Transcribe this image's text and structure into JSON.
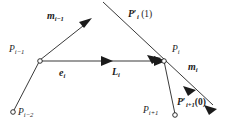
{
  "figure": {
    "type": "geometry-diagram",
    "background_color": "#ffffff",
    "stroke_color": "#3a3a3a",
    "text_color": "#1b1b1b"
  },
  "labels": {
    "m_prev": {
      "base": "m",
      "sub": "i−1"
    },
    "p_tangent_end": {
      "base": "P",
      "prime": "′",
      "sub": "i",
      "arg": "(1)"
    },
    "point_prev": {
      "base": "P",
      "sub": "i−1"
    },
    "point_current": {
      "base": "P",
      "sub": "i"
    },
    "point_prev2": {
      "base": "P",
      "sub": "i−2"
    },
    "point_next": {
      "base": "P",
      "sub": "i+1"
    },
    "edge_e": {
      "base": "e",
      "sub": "i"
    },
    "edge_L": {
      "base": "L",
      "sub": "i"
    },
    "m_current": {
      "base": "m",
      "sub": "i"
    },
    "p_tangent_start": {
      "base": "P",
      "prime": "′",
      "sub": "i+1",
      "arg": "(0)"
    }
  },
  "nodes": [
    {
      "name": "P_i-2",
      "x": 13,
      "y": 112
    },
    {
      "name": "P_i-1",
      "x": 40,
      "y": 60
    },
    {
      "name": "P_i",
      "x": 164,
      "y": 61
    },
    {
      "name": "P_i+1",
      "x": 175,
      "y": 115
    }
  ],
  "segments": [
    {
      "name": "edge-prev2-to-prev",
      "x1": 13,
      "y1": 112,
      "x2": 40,
      "y2": 60
    },
    {
      "name": "edge-prev-to-current",
      "x1": 40,
      "y1": 61,
      "x2": 164,
      "y2": 61
    },
    {
      "name": "edge-current-to-next",
      "x1": 164,
      "y1": 61,
      "x2": 175,
      "y2": 115
    },
    {
      "name": "director-prev-ray",
      "x1": 40,
      "y1": 60,
      "x2": 90,
      "y2": 20
    },
    {
      "name": "tangent-long-diagonal",
      "x1": 103,
      "y1": 2,
      "x2": 215,
      "y2": 107
    }
  ],
  "arrowheads": [
    {
      "name": "arrow-m-prev",
      "x": 90,
      "y": 20,
      "angle": -39
    },
    {
      "name": "arrow-e-mid",
      "x": 110,
      "y": 61,
      "angle": 0
    },
    {
      "name": "arrow-L-end",
      "x": 164,
      "y": 61,
      "angle": 0
    },
    {
      "name": "arrow-tangent-at-node",
      "x": 160,
      "y": 57,
      "angle": 43
    },
    {
      "name": "arrow-m-current",
      "x": 193,
      "y": 87,
      "angle": 43
    },
    {
      "name": "arrow-tangent-end",
      "x": 215,
      "y": 107,
      "angle": 43
    }
  ]
}
